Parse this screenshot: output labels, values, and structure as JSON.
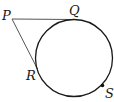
{
  "diagram": {
    "circle": {
      "cx": 74,
      "cy": 58,
      "r": 38.5,
      "stroke": "#1a1a1a"
    },
    "points": {
      "P": {
        "label": "P",
        "x": 12,
        "y": 19
      },
      "Q": {
        "label": "Q",
        "x": 73,
        "y": 19.5
      },
      "R": {
        "label": "R",
        "x": 37.5,
        "y": 69
      },
      "S": {
        "label": "S",
        "x": 102.5,
        "y": 85.5
      }
    },
    "segments": [
      {
        "from": "P",
        "to": "Q",
        "stroke": "#555555"
      },
      {
        "from": "P",
        "to": "R",
        "stroke": "#555555"
      }
    ],
    "labels": {
      "P": "P",
      "Q": "Q",
      "R": "R",
      "S": "S"
    }
  }
}
